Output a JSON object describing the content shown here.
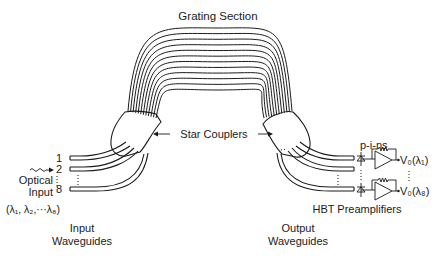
{
  "title": "Grating Section",
  "star_couplers_label": "Star Couplers",
  "input": {
    "port_labels": [
      "1",
      "2",
      "8"
    ],
    "optical_label_1": "Optical",
    "optical_label_2": "Input",
    "wavelengths": "(λ₁, λ₂,···λ₈)",
    "caption_1": "Input",
    "caption_2": "Waveguides"
  },
  "output": {
    "caption_1": "Output",
    "caption_2": "Waveguides",
    "detector_label": "p-i-ns",
    "outputs": [
      "V₀(λ₁)",
      "V₀(λ₈)"
    ],
    "preamp_label": "HBT Preamplifiers"
  },
  "grating_arm_count": 12
}
